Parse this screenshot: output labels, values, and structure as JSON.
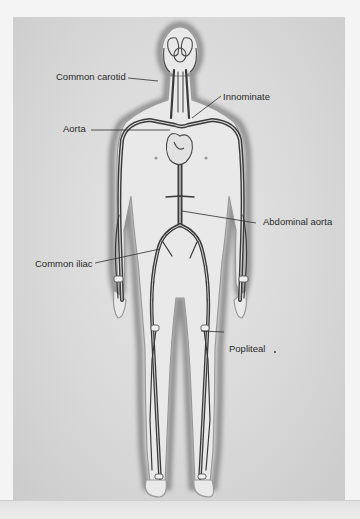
{
  "figure": {
    "labels": [
      {
        "id": "common-carotid",
        "text": "Common carotid"
      },
      {
        "id": "innominate",
        "text": "Innominate"
      },
      {
        "id": "aorta",
        "text": "Aorta"
      },
      {
        "id": "abdominal-aorta",
        "text": "Abdominal aorta"
      },
      {
        "id": "common-iliac",
        "text": "Common iliac"
      },
      {
        "id": "popliteal",
        "text": "Popliteal"
      }
    ]
  },
  "colors": {
    "background": "#d9d9d9",
    "body_outline": "#6a6a6a",
    "artery": "#3a3a3a",
    "label_text": "#2a2a2a"
  }
}
